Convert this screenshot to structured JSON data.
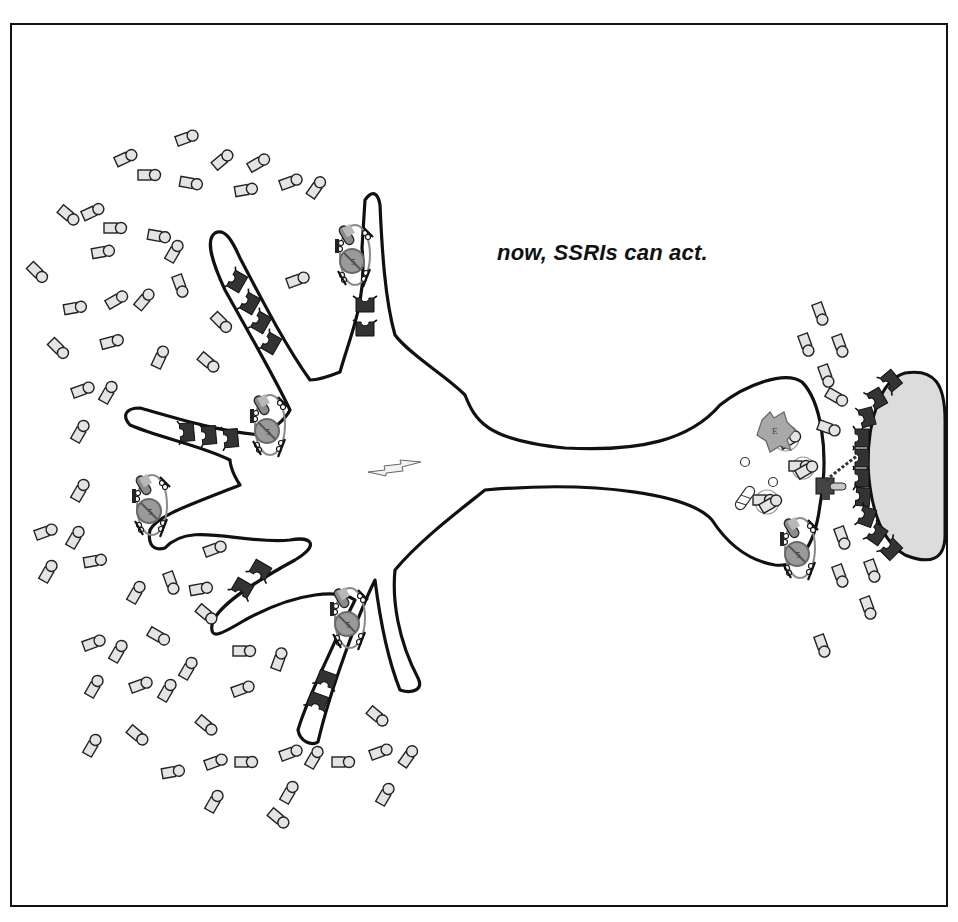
{
  "figure": {
    "caption": "now, SSRIs can act.",
    "frame": {
      "x": 11,
      "y": 24,
      "w": 936,
      "h": 882,
      "stroke": "#111111"
    },
    "colors": {
      "outline": "#111111",
      "receptor": "#333333",
      "molecule_fill": "#e4e4e4",
      "ssri_capsule": "#8c8c8c",
      "transporter_ring": "#8a8a8a",
      "postsynaptic_fill": "#dcdcdc",
      "enzyme_fill": "#a8a8a8"
    }
  },
  "labels": {
    "neuron": "presynaptic serotonin neuron",
    "postsynaptic": "postsynaptic neuron",
    "ssri": "SSRI",
    "transporter": "serotonin reuptake pump",
    "serotonin": "serotonin",
    "autoreceptor": "5HT1A somatodendritic autoreceptor",
    "terminal_autoreceptor": "5HT1D terminal autoreceptor",
    "enzyme": "MAO",
    "impulse": "neuronal impulse"
  },
  "ssri_blocked_transporters": [
    {
      "x": 355,
      "y": 255,
      "rot": 0
    },
    {
      "x": 270,
      "y": 425,
      "rot": 0
    },
    {
      "x": 152,
      "y": 505,
      "rot": 0
    },
    {
      "x": 350,
      "y": 618,
      "rot": 0
    },
    {
      "x": 800,
      "y": 548,
      "rot": 0
    }
  ],
  "serotonin_molecules": [
    [
      186,
      138,
      -20
    ],
    [
      125,
      158,
      -25
    ],
    [
      148,
      175,
      0
    ],
    [
      222,
      160,
      -40
    ],
    [
      258,
      163,
      -30
    ],
    [
      190,
      183,
      10
    ],
    [
      245,
      190,
      -10
    ],
    [
      290,
      182,
      -20
    ],
    [
      316,
      188,
      -55
    ],
    [
      68,
      215,
      40
    ],
    [
      92,
      212,
      -25
    ],
    [
      114,
      228,
      0
    ],
    [
      158,
      236,
      10
    ],
    [
      174,
      252,
      -60
    ],
    [
      102,
      252,
      -10
    ],
    [
      297,
      280,
      -20
    ],
    [
      37,
      272,
      45
    ],
    [
      74,
      308,
      -10
    ],
    [
      116,
      300,
      -30
    ],
    [
      144,
      300,
      -50
    ],
    [
      180,
      285,
      70
    ],
    [
      221,
      322,
      45
    ],
    [
      58,
      348,
      45
    ],
    [
      111,
      342,
      -15
    ],
    [
      160,
      358,
      -65
    ],
    [
      208,
      362,
      40
    ],
    [
      82,
      390,
      -20
    ],
    [
      108,
      393,
      -60
    ],
    [
      80,
      432,
      -60
    ],
    [
      80,
      491,
      -60
    ],
    [
      45,
      532,
      -20
    ],
    [
      75,
      538,
      -60
    ],
    [
      94,
      561,
      -10
    ],
    [
      48,
      572,
      -60
    ],
    [
      214,
      549,
      -20
    ],
    [
      136,
      593,
      -60
    ],
    [
      171,
      582,
      70
    ],
    [
      200,
      589,
      -10
    ],
    [
      206,
      614,
      40
    ],
    [
      93,
      643,
      -20
    ],
    [
      118,
      652,
      -60
    ],
    [
      158,
      636,
      30
    ],
    [
      188,
      669,
      -60
    ],
    [
      243,
      651,
      0
    ],
    [
      279,
      660,
      -70
    ],
    [
      94,
      687,
      -60
    ],
    [
      140,
      685,
      -20
    ],
    [
      167,
      691,
      -60
    ],
    [
      242,
      689,
      -20
    ],
    [
      137,
      735,
      40
    ],
    [
      206,
      725,
      40
    ],
    [
      92,
      746,
      -60
    ],
    [
      377,
      716,
      40
    ],
    [
      172,
      772,
      -10
    ],
    [
      215,
      762,
      -20
    ],
    [
      245,
      762,
      0
    ],
    [
      290,
      753,
      -20
    ],
    [
      314,
      758,
      -60
    ],
    [
      342,
      762,
      0
    ],
    [
      380,
      752,
      -20
    ],
    [
      408,
      757,
      -55
    ],
    [
      214,
      802,
      -60
    ],
    [
      289,
      793,
      -60
    ],
    [
      278,
      818,
      40
    ],
    [
      385,
      795,
      -60
    ],
    [
      820,
      313,
      70
    ],
    [
      806,
      344,
      70
    ],
    [
      840,
      345,
      70
    ],
    [
      826,
      375,
      70
    ],
    [
      836,
      397,
      30
    ],
    [
      828,
      428,
      20
    ],
    [
      842,
      537,
      70
    ],
    [
      840,
      575,
      70
    ],
    [
      872,
      570,
      70
    ],
    [
      868,
      607,
      70
    ],
    [
      822,
      645,
      70
    ]
  ],
  "somatodendritic_receptors": [
    {
      "x": 238,
      "y": 282,
      "rot": 30
    },
    {
      "x": 251,
      "y": 304,
      "rot": 30
    },
    {
      "x": 262,
      "y": 323,
      "rot": 30
    },
    {
      "x": 272,
      "y": 344,
      "rot": 30
    },
    {
      "x": 365,
      "y": 306,
      "rot": 90
    },
    {
      "x": 365,
      "y": 330,
      "rot": 90
    },
    {
      "x": 188,
      "y": 432,
      "rot": -5
    },
    {
      "x": 210,
      "y": 435,
      "rot": -5
    },
    {
      "x": 232,
      "y": 438,
      "rot": -5
    },
    {
      "x": 243,
      "y": 587,
      "rot": -60
    },
    {
      "x": 261,
      "y": 569,
      "rot": -60
    },
    {
      "x": 327,
      "y": 678,
      "rot": -70
    },
    {
      "x": 318,
      "y": 700,
      "rot": -70
    }
  ],
  "postsynaptic_receptors": [
    {
      "x": 892,
      "y": 380,
      "rot": -40
    },
    {
      "x": 878,
      "y": 398,
      "rot": -30
    },
    {
      "x": 868,
      "y": 417,
      "rot": -15
    },
    {
      "x": 863,
      "y": 438,
      "rot": 0
    },
    {
      "x": 863,
      "y": 458,
      "rot": 0
    },
    {
      "x": 863,
      "y": 478,
      "rot": 0
    },
    {
      "x": 864,
      "y": 497,
      "rot": 5
    },
    {
      "x": 868,
      "y": 517,
      "rot": 20
    },
    {
      "x": 878,
      "y": 535,
      "rot": 35
    },
    {
      "x": 892,
      "y": 550,
      "rot": 45
    }
  ],
  "vesicles": [
    {
      "x": 786,
      "y": 438,
      "r": 13
    },
    {
      "x": 803,
      "y": 468,
      "r": 11
    },
    {
      "x": 767,
      "y": 502,
      "r": 12
    }
  ]
}
